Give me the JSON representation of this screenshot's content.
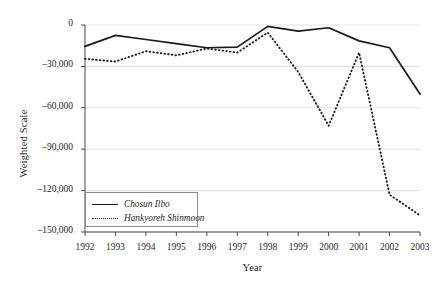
{
  "chart_data": {
    "type": "line",
    "title": "",
    "xlabel": "Year",
    "ylabel": "Weighted Scale",
    "categories": [
      "1992",
      "1993",
      "1994",
      "1995",
      "1996",
      "1997",
      "1998",
      "1999",
      "2000",
      "2001",
      "2002",
      "2003"
    ],
    "x": [
      1992,
      1993,
      1994,
      1995,
      1996,
      1997,
      1998,
      1999,
      2000,
      2001,
      2002,
      2003
    ],
    "xlim": [
      1992,
      2003
    ],
    "ylim": [
      -150000,
      0
    ],
    "yticks": [
      0,
      -30000,
      -60000,
      -90000,
      -120000,
      -150000
    ],
    "ytick_labels": [
      "0",
      "-30,000",
      "-60,000",
      "-90,000",
      "-120,000",
      "-150,000"
    ],
    "grid": "horizontal",
    "legend_position": "lower-left-inside",
    "series": [
      {
        "name": "Chosun Ilbo",
        "style": "solid",
        "color": "#1a1a1a",
        "values": [
          -15500,
          -7500,
          -10500,
          -13500,
          -16500,
          -16000,
          -1000,
          -4500,
          -2000,
          -11500,
          -16500,
          -50000
        ]
      },
      {
        "name": "Hankyoreh Shinmoon",
        "style": "dotted",
        "color": "#1a1a1a",
        "values": [
          -24500,
          -26500,
          -19000,
          -22000,
          -17000,
          -20000,
          -5500,
          -34000,
          -73000,
          -20000,
          -123000,
          -138000
        ]
      }
    ]
  },
  "axis": {
    "ylabel": "Weighted Scale",
    "xlabel": "Year"
  },
  "legend": {
    "items": [
      {
        "label": "Chosun Ilbo",
        "style": "solid"
      },
      {
        "label": "Hankyoreh Shinmoon",
        "style": "dotted"
      }
    ]
  },
  "colors": {
    "line": "#1a1a1a",
    "grid": "#e3e3e3",
    "axis": "#4a4a4a",
    "text": "#1f1f1f",
    "background": "#ffffff"
  }
}
